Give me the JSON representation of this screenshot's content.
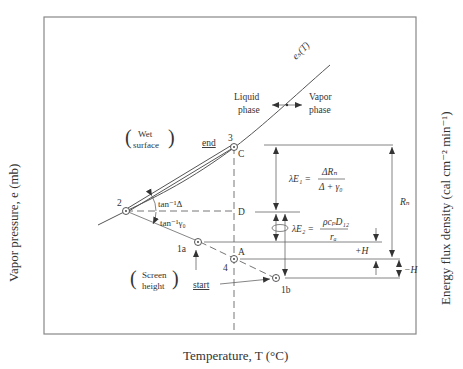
{
  "axes": {
    "x_label": "Temperature, T (°C)",
    "y_label_left": "Vapor pressure, e (mb)",
    "y_label_right": "Energy flux density (cal cm⁻² min⁻¹)"
  },
  "curve": {
    "label": "eₛ(T)"
  },
  "phases": {
    "liquid_line1": "Liquid",
    "liquid_line2": "phase",
    "vapor_line1": "Vapor",
    "vapor_line2": "phase"
  },
  "regions": {
    "wet_line1": "Wet",
    "wet_line2": "surface",
    "screen_line1": "Screen",
    "screen_line2": "height"
  },
  "points": {
    "p3": "3",
    "pC": "C",
    "p2": "2",
    "pD": "D",
    "p1a": "1a",
    "pA": "A",
    "p4": "4",
    "p1b": "1b"
  },
  "markers": {
    "end": "end",
    "start": "start"
  },
  "angles": {
    "upper": "tan⁻¹Δ",
    "lower": "tan⁻¹γ₀"
  },
  "equations": {
    "lE1_lhs": "λE₁ =",
    "lE1_num": "ΔRₙ",
    "lE1_den": "Δ + γ₀",
    "lE2_lhs": "λE₂ =",
    "lE2_num": "ρcₚD₁₂",
    "lE2_den": "rₐ",
    "Rn": "Rₙ",
    "plusH": "+H",
    "minusH": "−H"
  }
}
